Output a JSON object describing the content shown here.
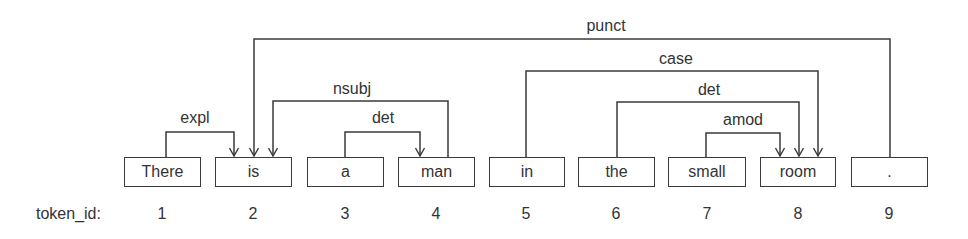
{
  "diagram": {
    "row_label": "token_id:",
    "tokens": [
      {
        "id": "1",
        "word": "There"
      },
      {
        "id": "2",
        "word": "is"
      },
      {
        "id": "3",
        "word": "a"
      },
      {
        "id": "4",
        "word": "man"
      },
      {
        "id": "5",
        "word": "in"
      },
      {
        "id": "6",
        "word": "the"
      },
      {
        "id": "7",
        "word": "small"
      },
      {
        "id": "8",
        "word": "room"
      },
      {
        "id": "9",
        "word": "."
      }
    ],
    "arcs": [
      {
        "label": "punct",
        "head": 2,
        "dependent": 9
      },
      {
        "label": "case",
        "head": 8,
        "dependent": 5
      },
      {
        "label": "nsubj",
        "head": 2,
        "dependent": 4
      },
      {
        "label": "det",
        "head": 8,
        "dependent": 6
      },
      {
        "label": "expl",
        "head": 2,
        "dependent": 1
      },
      {
        "label": "det",
        "head": 4,
        "dependent": 3
      },
      {
        "label": "amod",
        "head": 8,
        "dependent": 7
      }
    ],
    "colors": {
      "line": "#3a3a3a",
      "text": "#333333",
      "background": "#ffffff"
    }
  }
}
